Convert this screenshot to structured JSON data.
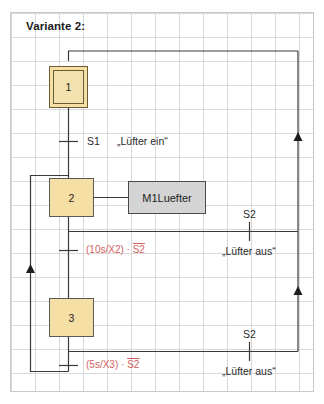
{
  "diagram": {
    "title": "Variante 2:",
    "type": "sequential-function-chart",
    "steps": [
      {
        "id": "1",
        "label": "1",
        "kind": "initial"
      },
      {
        "id": "2",
        "label": "2",
        "kind": "normal"
      },
      {
        "id": "3",
        "label": "3",
        "kind": "normal"
      }
    ],
    "actions": [
      {
        "label": "M1Luefter",
        "attached_to_step": "2"
      }
    ],
    "transitions": [
      {
        "name": "t1",
        "condition": "S1",
        "comment": "„Lüfter ein“",
        "color": "#2a2a2a"
      },
      {
        "name": "t2",
        "condition_prefix": "(10s/X2) · ",
        "condition_overlined": "S2",
        "color": "#d1615f"
      },
      {
        "name": "t3",
        "condition": "S2",
        "comment": "„Lüfter aus“",
        "color": "#2a2a2a"
      },
      {
        "name": "t4",
        "condition_prefix": "(5s/X3) · ",
        "condition_overlined": "S2",
        "color": "#d1615f"
      },
      {
        "name": "t5",
        "condition": "S2",
        "comment": "„Lüfter aus“",
        "color": "#2a2a2a"
      }
    ],
    "colors": {
      "step_fill": "#f6dfa4",
      "step_border": "#5a5a5a",
      "action_fill": "#d4d4d4",
      "action_border": "#4a4a4a",
      "line": "#3a3a3a",
      "grid": "#d9d9d9",
      "red_text": "#d1615f",
      "dark_text": "#2a2a2a"
    }
  }
}
